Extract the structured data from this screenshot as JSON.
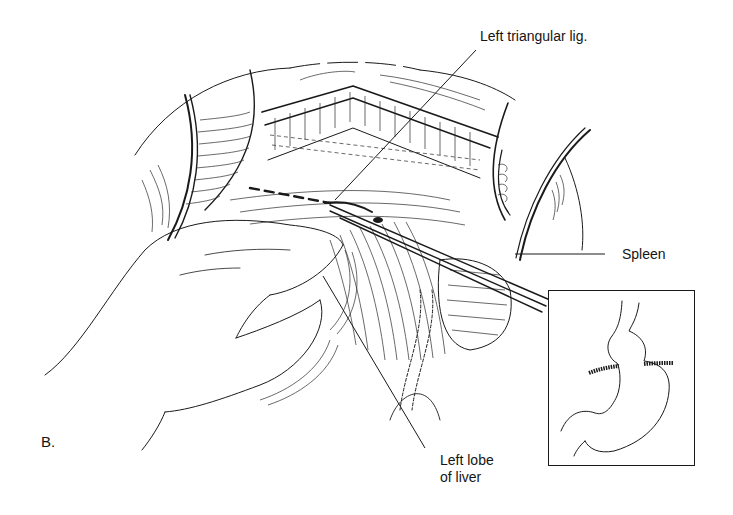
{
  "figure": {
    "panel_label": "B.",
    "labels": {
      "left_triangular_lig": "Left triangular lig.",
      "spleen": "Spleen",
      "left_lobe_line1": "Left lobe",
      "left_lobe_line2": "of liver"
    },
    "inset": {
      "subject": "stomach outline with diaphragm hiatus"
    },
    "colors": {
      "ink": "#1a1a1a",
      "background": "#ffffff"
    }
  }
}
